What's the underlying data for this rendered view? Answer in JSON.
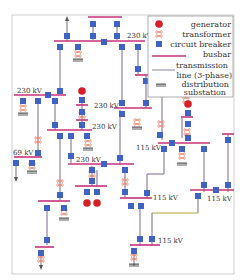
{
  "legend": {
    "items": [
      {
        "symbol": "generator-icon",
        "label": "generator"
      },
      {
        "symbol": "transformer-icon",
        "label": "transformer"
      },
      {
        "symbol": "circuit-breaker-icon",
        "label": "circuit breaker"
      },
      {
        "symbol": "busbar-icon",
        "label": "busbar"
      },
      {
        "symbol": "transmission-line-icon",
        "label_line1": "transmission",
        "label_line2": "line (3-phase)"
      },
      {
        "symbol": "distribution-substation-icon",
        "label_line1": "distribution",
        "label_line2": "substation"
      }
    ]
  },
  "voltage_labels": [
    {
      "id": "top-right-bus",
      "text": "230 kV"
    },
    {
      "id": "left-bus",
      "text": "230 kV"
    },
    {
      "id": "center-upper-bus",
      "text": "230 kV"
    },
    {
      "id": "center-mid-bus",
      "text": "230 kV"
    },
    {
      "id": "center-lower-bus",
      "text": "230 kV"
    },
    {
      "id": "left-low-bus",
      "text": "69 kV"
    },
    {
      "id": "right-mid-bus",
      "text": "115 kV"
    },
    {
      "id": "center-115-bus",
      "text": "115 kV"
    },
    {
      "id": "far-right-bus",
      "text": "115 kV"
    },
    {
      "id": "bottom-bus",
      "text": "115 kV"
    }
  ],
  "colors": {
    "busbar": "#c8327a",
    "circuit_breaker": "#3f63c4",
    "generator": "#d81f26",
    "transformer": "#e48a70",
    "transmission_line": "#9a8aaa"
  }
}
